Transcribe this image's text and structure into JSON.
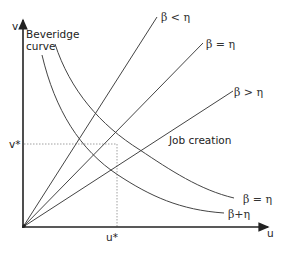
{
  "diagram": {
    "axes": {
      "y_label": "v",
      "x_label": "u",
      "v_star_label": "v*",
      "u_star_label": "u*"
    },
    "beveridge_label": [
      "Beveridge",
      "curve"
    ],
    "job_creation_label": "Job creation",
    "job_creation_lines": [
      {
        "label": "β < η"
      },
      {
        "label": "β = η"
      },
      {
        "label": "β > η"
      }
    ],
    "beveridge_curves": [
      {
        "label": "β = η"
      },
      {
        "label": "β+η"
      }
    ],
    "colors": {
      "line": "#444444",
      "axis": "#222222",
      "dotted": "#888888"
    }
  }
}
